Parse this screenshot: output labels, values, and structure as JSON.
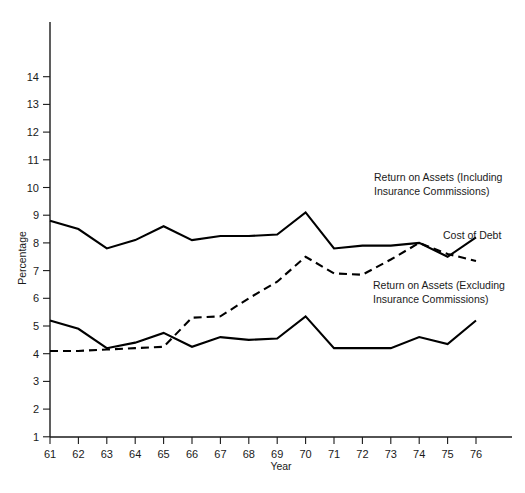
{
  "chart_data": {
    "type": "line",
    "title": "",
    "xlabel": "Year",
    "ylabel": "Percentage",
    "x": [
      61,
      62,
      63,
      64,
      65,
      66,
      67,
      68,
      69,
      70,
      71,
      72,
      73,
      74,
      75,
      76
    ],
    "xticklabels": [
      "61",
      "62",
      "63",
      "64",
      "65",
      "66",
      "67",
      "68",
      "69",
      "70",
      "71",
      "72",
      "73",
      "74",
      "75",
      "76"
    ],
    "yticklabels": [
      "1",
      "2",
      "3",
      "4",
      "5",
      "6",
      "7",
      "8",
      "9",
      "10",
      "11",
      "12",
      "13",
      "14"
    ],
    "yticks": [
      1,
      2,
      3,
      4,
      5,
      6,
      7,
      8,
      9,
      10,
      11,
      12,
      13,
      14
    ],
    "xlim": [
      61,
      76
    ],
    "ylim": [
      0,
      14.8
    ],
    "grid": false,
    "legend_position": "inline-annotations",
    "series": [
      {
        "name": "Return on Assets (Including Insurance Commissions)",
        "style": "solid",
        "values": [
          8.8,
          8.5,
          7.8,
          8.1,
          8.6,
          8.1,
          8.25,
          8.25,
          8.3,
          9.1,
          7.8,
          7.9,
          7.9,
          8.0,
          7.5,
          8.2
        ]
      },
      {
        "name": "Cost of Debt",
        "style": "dashed",
        "values": [
          4.1,
          4.1,
          4.15,
          4.2,
          4.25,
          5.3,
          5.35,
          6.0,
          6.6,
          7.5,
          6.9,
          6.85,
          7.4,
          8.0,
          7.6,
          7.35
        ]
      },
      {
        "name": "Return on Assets (Excluding Insurance Commissions)",
        "style": "solid",
        "values": [
          5.2,
          4.9,
          4.2,
          4.4,
          4.75,
          4.25,
          4.6,
          4.5,
          4.55,
          5.35,
          4.2,
          4.2,
          4.2,
          4.6,
          4.35,
          5.2
        ]
      }
    ],
    "annotations": [
      {
        "name": "return-on-assets-including",
        "lines": [
          "Return on Assets (Including",
          "Insurance Commissions)"
        ],
        "x": 374,
        "y": 181
      },
      {
        "name": "cost-of-debt",
        "lines": [
          "Cost of Debt"
        ],
        "x": 443,
        "y": 239
      },
      {
        "name": "return-on-assets-excluding",
        "lines": [
          "Return on Assets (Excluding",
          "Insurance Commissions)"
        ],
        "x": 373,
        "y": 289
      }
    ]
  },
  "axes": {
    "x_title": "Year",
    "y_title": "Percentage"
  },
  "colors": {
    "line": "#000000",
    "axis": "#1a1a1a",
    "text": "#1a1a1a",
    "background": "#ffffff"
  }
}
